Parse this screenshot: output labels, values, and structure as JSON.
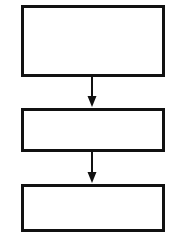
{
  "diagram": {
    "type": "flowchart",
    "orientation": "vertical-top-to-bottom",
    "canvas": {
      "width": 176,
      "height": 238
    },
    "background_color": "#ffffff",
    "stroke_color": "#111111",
    "fill_color": "#ffffff",
    "nodes": [
      {
        "id": "node-1",
        "shape": "rectangle",
        "label": "",
        "x": 21,
        "y": 5,
        "width": 144,
        "height": 72,
        "border_width": 3
      },
      {
        "id": "node-2",
        "shape": "rectangle",
        "label": "",
        "x": 21,
        "y": 108,
        "width": 144,
        "height": 44,
        "border_width": 3
      },
      {
        "id": "node-3",
        "shape": "rectangle",
        "label": "",
        "x": 21,
        "y": 184,
        "width": 144,
        "height": 48,
        "border_width": 3
      }
    ],
    "connectors": [
      {
        "id": "connector-1",
        "from": "node-1",
        "to": "node-2",
        "label": "",
        "arrowhead": "filled-triangle",
        "x": 92,
        "y1": 77,
        "y2": 108,
        "line_width": 2,
        "head_width": 9,
        "head_length": 11
      },
      {
        "id": "connector-2",
        "from": "node-2",
        "to": "node-3",
        "label": "",
        "arrowhead": "filled-triangle",
        "x": 92,
        "y1": 152,
        "y2": 184,
        "line_width": 2,
        "head_width": 9,
        "head_length": 11
      }
    ]
  }
}
